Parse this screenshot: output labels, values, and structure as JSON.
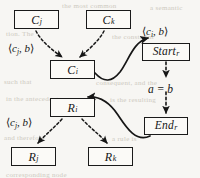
{
  "figure": {
    "name": "call-graph-and-rule-graph-mapping-diagram",
    "background_color": "#f7f6f3",
    "ink_color": "#161616"
  },
  "nodes": [
    {
      "id": "c_j",
      "base": "C",
      "sub": "j",
      "x": 14,
      "y": 10,
      "w": 45,
      "h": 19
    },
    {
      "id": "c_k",
      "base": "C",
      "sub": "k",
      "x": 86,
      "y": 10,
      "w": 45,
      "h": 19
    },
    {
      "id": "c_i",
      "base": "C",
      "sub": "i",
      "x": 50,
      "y": 60,
      "w": 45,
      "h": 19
    },
    {
      "id": "r_i",
      "base": "R",
      "sub": "i",
      "x": 50,
      "y": 98,
      "w": 45,
      "h": 19
    },
    {
      "id": "r_j",
      "base": "R",
      "sub": "j",
      "x": 11,
      "y": 147,
      "w": 45,
      "h": 19
    },
    {
      "id": "r_k",
      "base": "R",
      "sub": "k",
      "x": 88,
      "y": 147,
      "w": 45,
      "h": 19
    },
    {
      "id": "start_r",
      "base": "Start",
      "sub": "r",
      "x": 142,
      "y": 43,
      "w": 48,
      "h": 18
    },
    {
      "id": "end_r",
      "base": "End",
      "sub": "r",
      "x": 144,
      "y": 117,
      "w": 44,
      "h": 18
    }
  ],
  "labels": {
    "call_pair_left_top": {
      "open": "⟨",
      "base": "c",
      "sub": "j",
      "rest": ", b",
      "close": "⟩",
      "x": 8,
      "y": 43
    },
    "call_pair_left_bottom": {
      "open": "⟨",
      "base": "c",
      "sub": "j",
      "rest": ", b",
      "close": "⟩",
      "x": 6,
      "y": 117
    },
    "call_pair_right_top": {
      "open": "⟨",
      "base": "c",
      "sub": "i",
      "rest": ", b",
      "close": "⟩",
      "x": 142,
      "y": 26
    },
    "condition": {
      "text": "a = b",
      "x": 148,
      "y": 84
    }
  },
  "edges": [
    {
      "id": "cj-to-ci",
      "style": "dashed",
      "from": "c_j",
      "to": "c_i"
    },
    {
      "id": "ck-to-ci",
      "style": "dashed",
      "from": "c_k",
      "to": "c_i"
    },
    {
      "id": "ci-to-startr",
      "style": "solid",
      "from": "c_i",
      "to": "start_r"
    },
    {
      "id": "startr-to-endr",
      "style": "dashed",
      "from": "start_r",
      "to": "end_r"
    },
    {
      "id": "endr-to-ri",
      "style": "solid",
      "from": "end_r",
      "to": "r_i"
    },
    {
      "id": "ri-to-rj",
      "style": "dashed",
      "from": "r_i",
      "to": "r_j"
    },
    {
      "id": "ri-to-rk",
      "style": "dashed",
      "from": "r_i",
      "to": "r_k"
    }
  ],
  "bleed_through": [
    {
      "text": "the most common",
      "x": 62,
      "y": 2
    },
    {
      "text": "a semantic",
      "x": 150,
      "y": 4
    },
    {
      "text": "tion. The",
      "x": 6,
      "y": 30
    },
    {
      "text": "the constraint",
      "x": 112,
      "y": 33
    },
    {
      "text": "such that",
      "x": 4,
      "y": 78
    },
    {
      "text": "consequent, and the",
      "x": 96,
      "y": 79
    },
    {
      "text": "in the antecedent",
      "x": 6,
      "y": 95
    },
    {
      "text": "is the resulting",
      "x": 110,
      "y": 96
    },
    {
      "text": "and therefore",
      "x": 4,
      "y": 134
    },
    {
      "text": "a rule is",
      "x": 112,
      "y": 135
    },
    {
      "text": "corresponding node",
      "x": 6,
      "y": 171
    }
  ]
}
